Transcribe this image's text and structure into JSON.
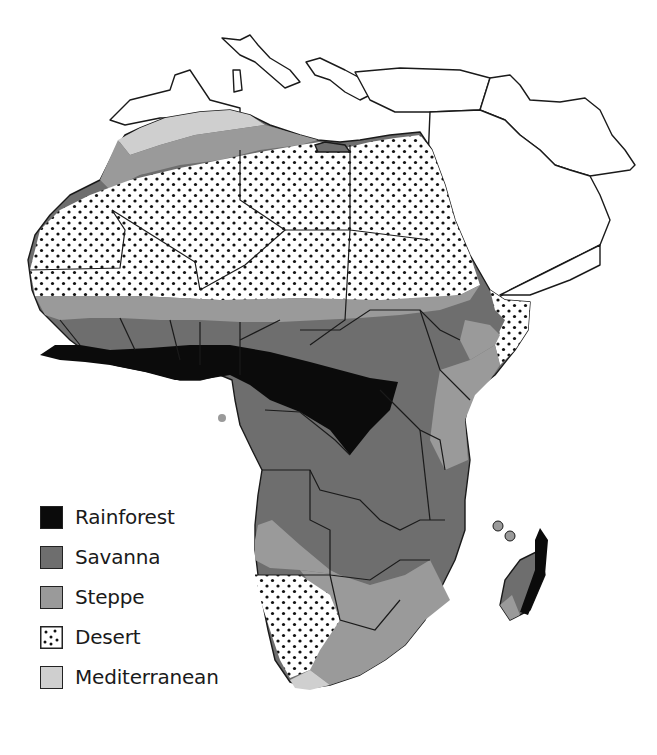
{
  "map": {
    "title_fragment": "Climate Map of Africa",
    "region": "Africa",
    "colors": {
      "rainforest": "#0b0b0b",
      "savanna": "#6e6e6e",
      "steppe": "#9a9a9a",
      "desert_bg": "#ffffff",
      "desert_dot": "#111111",
      "mediterranean": "#cfcfcf",
      "border": "#1a1a1a",
      "land_unshaded": "#ffffff"
    }
  },
  "legend": {
    "items": [
      {
        "label": "Rainforest",
        "key": "rainforest"
      },
      {
        "label": "Savanna",
        "key": "savanna"
      },
      {
        "label": "Steppe",
        "key": "steppe"
      },
      {
        "label": "Desert",
        "key": "desert"
      },
      {
        "label": "Mediterranean",
        "key": "mediterranean"
      }
    ]
  }
}
